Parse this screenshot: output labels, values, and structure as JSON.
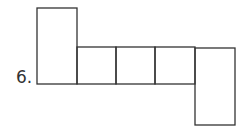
{
  "problem": {
    "number_label": "6."
  },
  "diagram": {
    "type": "cube-net",
    "stroke_color": "#333333",
    "squares": [
      {
        "name": "top-left-tall",
        "x": 37,
        "y": 8,
        "w": 40,
        "h": 76
      },
      {
        "name": "row-1",
        "x": 77,
        "y": 47,
        "w": 39,
        "h": 37
      },
      {
        "name": "row-2",
        "x": 116,
        "y": 47,
        "w": 39,
        "h": 37
      },
      {
        "name": "row-3",
        "x": 155,
        "y": 47,
        "w": 40,
        "h": 37
      },
      {
        "name": "bottom-right-tall",
        "x": 195,
        "y": 48,
        "w": 40,
        "h": 77
      }
    ]
  }
}
